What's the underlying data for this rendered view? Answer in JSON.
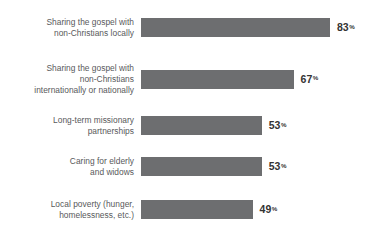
{
  "chart_data": {
    "type": "bar",
    "orientation": "horizontal",
    "title": "",
    "subtitle": "",
    "xlabel": "",
    "ylabel": "",
    "xlim": [
      0,
      100
    ],
    "grid": false,
    "legend": null,
    "value_suffix": "%",
    "bar_color": "#6d6e70",
    "label_color": "#58595b",
    "value_color": "#333333",
    "categories": [
      "Sharing the gospel with\nnon-Christians locally",
      "Sharing the gospel with\nnon-Christians\ninternationally or nationally",
      "Long-term missionary\npartnerships",
      "Caring for elderly\nand widows",
      "Local poverty (hunger,\nhomelessness, etc.)"
    ],
    "values": [
      83,
      67,
      53,
      53,
      49
    ],
    "value_labels": [
      "83",
      "67",
      "53",
      "53",
      "49"
    ]
  },
  "bars": [
    {
      "label": "Sharing the gospel with\nnon-Christians locally",
      "value": 83,
      "value_label": "83",
      "suffix": "%"
    },
    {
      "label": "Sharing the gospel with\nnon-Christians\ninternationally or nationally",
      "value": 67,
      "value_label": "67",
      "suffix": "%"
    },
    {
      "label": "Long-term missionary\npartnerships",
      "value": 53,
      "value_label": "53",
      "suffix": "%"
    },
    {
      "label": "Caring for elderly\nand widows",
      "value": 53,
      "value_label": "53",
      "suffix": "%"
    },
    {
      "label": "Local poverty (hunger,\nhomelessness, etc.)",
      "value": 49,
      "value_label": "49",
      "suffix": "%"
    }
  ]
}
